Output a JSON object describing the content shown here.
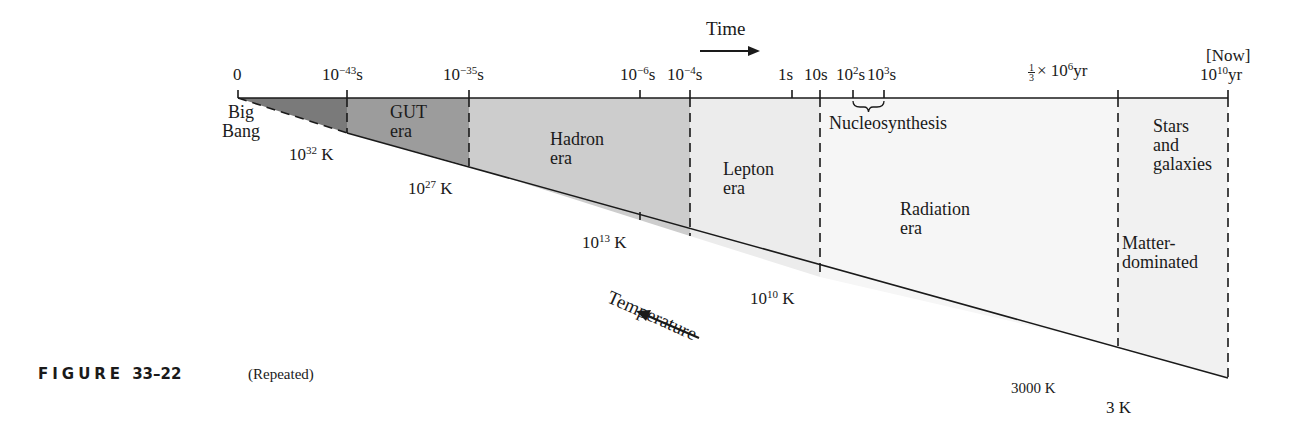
{
  "figure": {
    "label": "FIGURE",
    "number": "33–22",
    "note": "(Repeated)"
  },
  "axis": {
    "time_label": "Time",
    "temperature_label": "Temperature"
  },
  "time_ticks": [
    {
      "base": "0",
      "exp": "",
      "unit": ""
    },
    {
      "base": "10",
      "exp": "−43",
      "unit": "s"
    },
    {
      "base": "10",
      "exp": "−35",
      "unit": "s"
    },
    {
      "base": "10",
      "exp": "−6",
      "unit": "s"
    },
    {
      "base": "10",
      "exp": "−4",
      "unit": "s"
    },
    {
      "base": "1s",
      "exp": "",
      "unit": ""
    },
    {
      "base": "10s",
      "exp": "",
      "unit": ""
    },
    {
      "base": "10",
      "exp": "2",
      "unit": "s"
    },
    {
      "base": "10",
      "exp": "3",
      "unit": "s"
    },
    {
      "frac_num": "1",
      "frac_den": "3",
      "base": "× 10",
      "exp": "6",
      "unit": "yr"
    },
    {
      "above": "[Now]",
      "base": "10",
      "exp": "10",
      "unit": "yr"
    }
  ],
  "temperature_ticks": [
    {
      "base": "10",
      "exp": "32",
      "unit": " K"
    },
    {
      "base": "10",
      "exp": "27",
      "unit": " K"
    },
    {
      "base": "10",
      "exp": "13",
      "unit": " K"
    },
    {
      "base": "10",
      "exp": "10",
      "unit": " K"
    },
    {
      "base": "3000 K",
      "exp": "",
      "unit": ""
    },
    {
      "base": "3 K",
      "exp": "",
      "unit": ""
    }
  ],
  "start_label": {
    "line1": "Big",
    "line2": "Bang"
  },
  "eras": [
    {
      "line1": "GUT",
      "line2": "era",
      "color": "#8f8f8f"
    },
    {
      "line1": "Hadron",
      "line2": "era",
      "color": "#c9c9c9"
    },
    {
      "line1": "Lepton",
      "line2": "era",
      "color": "#ececec"
    },
    {
      "line1": "Radiation",
      "line2": "era",
      "color": "#f7f7f7"
    },
    {
      "line1": "Stars",
      "line2": "and",
      "line3": "galaxies",
      "color": "#f3f3f3"
    },
    {
      "line1": "Matter-",
      "line2": "dominated",
      "color": "#f3f3f3"
    }
  ],
  "planck_color": "#6e6e6e",
  "nucleosynthesis_label": "Nucleosynthesis"
}
